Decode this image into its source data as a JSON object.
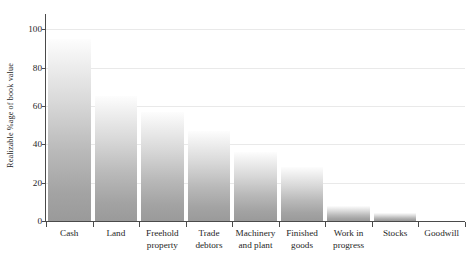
{
  "chart_data": {
    "type": "bar",
    "title": "",
    "xlabel": "",
    "ylabel": "Realizable %age of book value",
    "ylim": [
      0,
      108
    ],
    "yticks": [
      0,
      20,
      40,
      60,
      80,
      100
    ],
    "grid": true,
    "legend": "none",
    "categories": [
      "Cash",
      "Land",
      "Freehold property",
      "Trade debtors",
      "Machinery and plant",
      "Finished goods",
      "Work in progress",
      "Stocks",
      "Goodwill"
    ],
    "category_lines": [
      [
        "Cash"
      ],
      [
        "Land"
      ],
      [
        "Freehold",
        "property"
      ],
      [
        "Trade",
        "debtors"
      ],
      [
        "Machinery",
        "and plant"
      ],
      [
        "Finished",
        "goods"
      ],
      [
        "Work in",
        "progress"
      ],
      [
        "Stocks"
      ],
      [
        "Goodwill"
      ]
    ],
    "values": [
      95,
      65,
      57,
      47,
      36,
      28,
      8,
      4,
      0
    ],
    "bar_fill": "linear-gradient white-to-grey",
    "axis_color": "#4a4a4a",
    "grid_color": "#e9e9e9"
  }
}
